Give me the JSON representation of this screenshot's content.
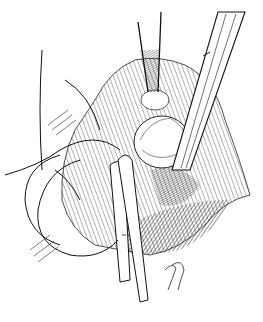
{
  "illustration": {
    "subject": "surgical-field-line-drawing",
    "background": "#ffffff",
    "ink": "#111111",
    "shade_mid": "#555555",
    "shade_light": "#9a9a9a",
    "signature": "signature-illegible"
  }
}
